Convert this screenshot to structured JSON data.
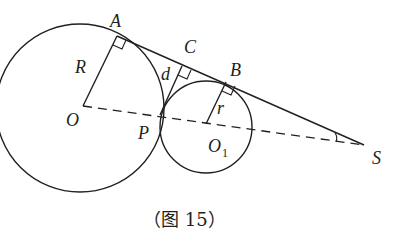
{
  "labels": {
    "A": "A",
    "B": "B",
    "C": "C",
    "R": "R",
    "d": "d",
    "r": "r",
    "O": "O",
    "P": "P",
    "O1_main": "O",
    "O1_sub": "1",
    "S": "S"
  },
  "caption": "（图 15）",
  "colors": {
    "stroke": "#231f20",
    "background": "#ffffff"
  }
}
